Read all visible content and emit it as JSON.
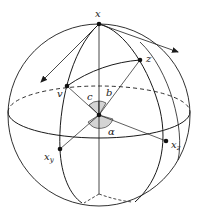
{
  "figure": {
    "labels": {
      "x": "x",
      "v": "v",
      "z": "z",
      "b": "b",
      "c": "c",
      "alpha": "α",
      "xy_main": "x",
      "xy_sub": "y",
      "xz_main": "x",
      "xz_sub": "z"
    },
    "colors": {
      "stroke": "#1a1a1a",
      "angle_fill": "#d4d4d4",
      "background": "#ffffff"
    }
  }
}
